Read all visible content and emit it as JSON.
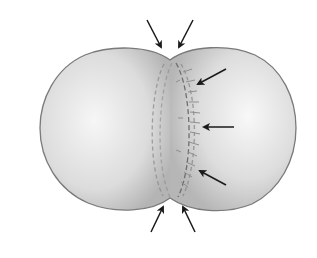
{
  "diagram": {
    "colors": {
      "background": "#ffffff",
      "cell_fill_light": "#f4f4f4",
      "cell_fill_dark": "#b9b9b9",
      "cell_outline": "#7a7a7a",
      "microfilament_ring": "#8a8a8a",
      "arrow": "#1a1a1a"
    },
    "arrows": [
      {
        "name": "top-left-arrow",
        "x1": 147,
        "y1": 20,
        "x2": 162,
        "y2": 48
      },
      {
        "name": "top-right-arrow",
        "x1": 193,
        "y1": 20,
        "x2": 178,
        "y2": 48
      },
      {
        "name": "upper-right-arrow",
        "x1": 226,
        "y1": 69,
        "x2": 197,
        "y2": 85
      },
      {
        "name": "middle-right-arrow",
        "x1": 234,
        "y1": 127,
        "x2": 204,
        "y2": 127
      },
      {
        "name": "lower-right-arrow",
        "x1": 226,
        "y1": 185,
        "x2": 199,
        "y2": 170
      },
      {
        "name": "bottom-left-arrow",
        "x1": 151,
        "y1": 232,
        "x2": 164,
        "y2": 206
      },
      {
        "name": "bottom-right-arrow",
        "x1": 195,
        "y1": 232,
        "x2": 182,
        "y2": 206
      }
    ]
  }
}
